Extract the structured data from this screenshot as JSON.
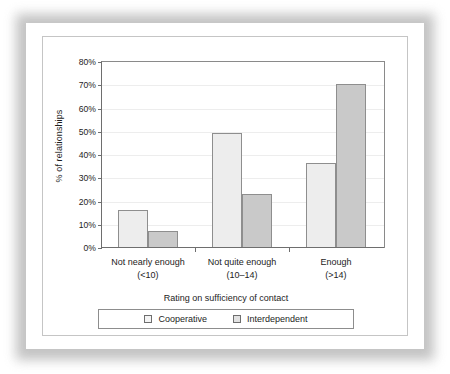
{
  "chart_data": {
    "type": "bar",
    "title": "",
    "xlabel": "Rating on sufficiency of contact",
    "ylabel": "% of relationships",
    "categories": [
      "Not nearly enough",
      "Not quite enough",
      "Enough"
    ],
    "category_sublabels": [
      "(<10)",
      "(10–14)",
      "(>14)"
    ],
    "series": [
      {
        "name": "Cooperative",
        "values": [
          16,
          49,
          36
        ],
        "color": "#ededed"
      },
      {
        "name": "Interdependent",
        "values": [
          7,
          23,
          70
        ],
        "color": "#c9c9c9"
      }
    ],
    "ylim": [
      0,
      80
    ],
    "ytick_labels": [
      "80%",
      "70%",
      "60%",
      "50%",
      "40%",
      "30%",
      "20%",
      "10%",
      "0%"
    ],
    "ytick_values": [
      80,
      70,
      60,
      50,
      40,
      30,
      20,
      10,
      0
    ],
    "grid": true,
    "legend_position": "bottom"
  },
  "legend": {
    "items": [
      {
        "label": "Cooperative"
      },
      {
        "label": "Interdependent"
      }
    ]
  }
}
